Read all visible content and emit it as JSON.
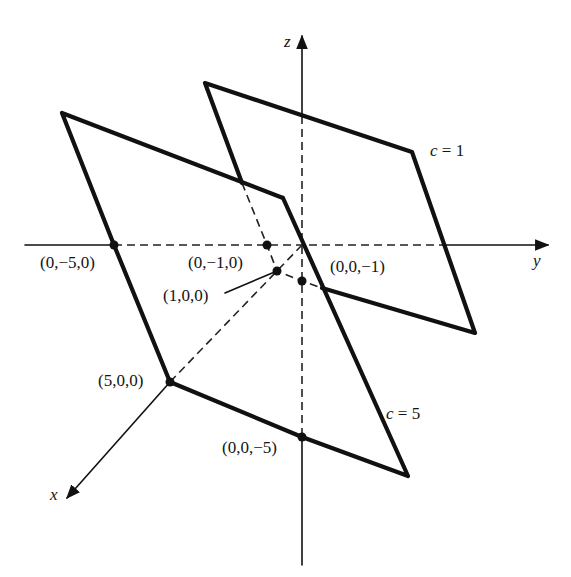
{
  "figure": {
    "axes": {
      "x_label": "x",
      "y_label": "y",
      "z_label": "z"
    },
    "planes": [
      {
        "name": "plane-c1",
        "label": "c = 1",
        "intercepts": {
          "x": "(1,0,0)",
          "y": "(0,−1,0)",
          "z": "(0,0,−1)"
        }
      },
      {
        "name": "plane-c5",
        "label": "c = 5",
        "intercepts": {
          "x": "(5,0,0)",
          "y": "(0,−5,0)",
          "z": "(0,0,−5)"
        }
      }
    ],
    "points": [
      {
        "label": "(0,−5,0)"
      },
      {
        "label": "(0,−1,0)"
      },
      {
        "label": "(1,0,0)"
      },
      {
        "label": "(0,0,−1)"
      },
      {
        "label": "(5,0,0)"
      },
      {
        "label": "(0,0,−5)"
      }
    ]
  }
}
